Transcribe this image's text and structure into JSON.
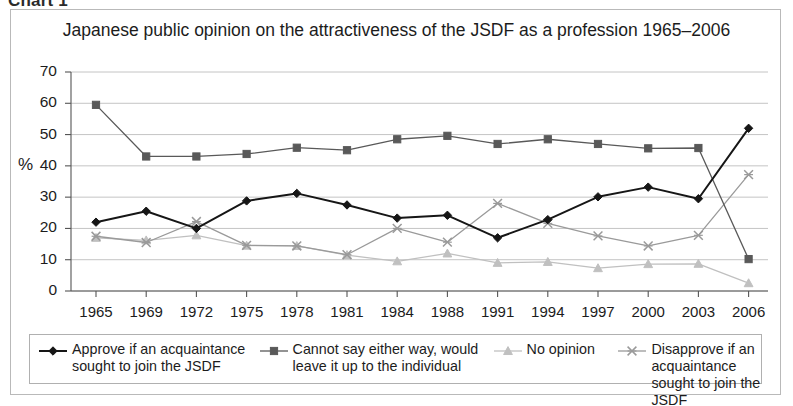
{
  "caption": "Chart 1",
  "chart_title": "Japanese public opinion on the attractiveness of the JSDF as a profession 1965–2006",
  "axis": {
    "ylabel": "%",
    "yticks": [
      "70",
      "60",
      "50",
      "40",
      "30",
      "20",
      "10",
      "0"
    ],
    "xticks": [
      "1965",
      "1969",
      "1972",
      "1975",
      "1978",
      "1981",
      "1984",
      "1988",
      "1991",
      "1994",
      "1997",
      "2000",
      "2003",
      "2006"
    ]
  },
  "legend": [
    {
      "label": "Approve if an acquaintance\nsought to join the JSDF",
      "marker": "diamond",
      "color": "#161616"
    },
    {
      "label": "Cannot say either way, would\nleave it up to the individual",
      "marker": "square",
      "color": "#595959"
    },
    {
      "label": "No opinion",
      "marker": "triangle",
      "color": "#c0c0c0"
    },
    {
      "label": "Disapprove if an acquaintance\nsought to join the JSDF",
      "marker": "cross",
      "color": "#9a9a9a"
    }
  ],
  "chart_data": {
    "type": "line",
    "title": "Japanese public opinion on the attractiveness of the JSDF as a profession 1965–2006",
    "xlabel": "",
    "ylabel": "%",
    "ylim": [
      0,
      70
    ],
    "ytick_step": 10,
    "grid": true,
    "legend_position": "bottom",
    "categories": [
      "1965",
      "1969",
      "1972",
      "1975",
      "1978",
      "1981",
      "1984",
      "1988",
      "1991",
      "1994",
      "1997",
      "2000",
      "2003",
      "2006"
    ],
    "series": [
      {
        "name": "Approve if an acquaintance sought to join the JSDF",
        "marker": "diamond",
        "color": "#161616",
        "values": [
          22,
          25.5,
          20,
          28.8,
          31.2,
          27.5,
          23.3,
          24.2,
          17,
          22.8,
          30.1,
          33.2,
          29.5,
          52
        ]
      },
      {
        "name": "Cannot say either way, would leave it up to the individual",
        "marker": "square",
        "color": "#595959",
        "values": [
          59.5,
          43,
          43,
          43.8,
          45.8,
          45,
          48.5,
          49.6,
          47,
          48.5,
          47,
          45.6,
          45.7,
          10.2
        ]
      },
      {
        "name": "No opinion",
        "marker": "triangle",
        "color": "#c0c0c0",
        "values": [
          17,
          16.2,
          17.8,
          14.5,
          14.4,
          11.5,
          9.5,
          12,
          9,
          9.3,
          7.3,
          8.6,
          8.7,
          2.5
        ]
      },
      {
        "name": "Disapprove if an acquaintance sought to join the JSDF",
        "marker": "cross",
        "color": "#9a9a9a",
        "values": [
          17.5,
          15.5,
          22.2,
          14.6,
          14.4,
          11.6,
          20,
          15.6,
          28,
          21.6,
          17.6,
          14.4,
          17.8,
          37.2
        ]
      }
    ]
  }
}
